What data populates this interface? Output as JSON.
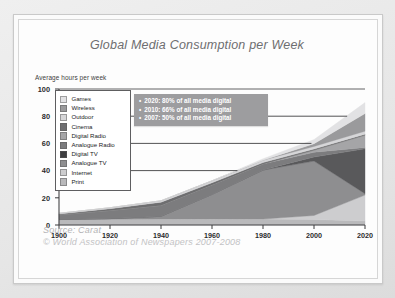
{
  "figure": {
    "title": "Global Media Consumption per Week",
    "source_label": "Source:  Carat",
    "copyright": "© World Association of Newspapers 2007-2008"
  },
  "annotation": {
    "bullet": "•",
    "lines": [
      "2020: 80% of all media digital",
      "2010: 66% of all media digital",
      "2007: 50% of all media digital"
    ],
    "background": "#9d9d9f",
    "text_color": "#ffffff"
  },
  "chart_data": {
    "type": "area",
    "title": "Global Media Consumption per Week",
    "xlabel": "",
    "ylabel": "Average hours per week",
    "xlim": [
      1900,
      2020
    ],
    "ylim": [
      0,
      100
    ],
    "grid": false,
    "stacked": true,
    "legend_position": "inside-top-left",
    "x": [
      1900,
      1920,
      1940,
      1960,
      1980,
      2000,
      2020
    ],
    "xticks": [
      "1900",
      "1920",
      "1940",
      "1960",
      "1980",
      "2000",
      "2020"
    ],
    "yticks": [
      "0",
      "20",
      "40",
      "60",
      "80",
      "100"
    ],
    "series": [
      {
        "name": "Print",
        "color": "#b9b9bb",
        "values": [
          4.0,
          4.2,
          4.4,
          4.5,
          4.4,
          4.0,
          3.0
        ]
      },
      {
        "name": "Internet",
        "color": "#cdcdcf",
        "values": [
          0.0,
          0.0,
          0.0,
          0.0,
          0.0,
          3.0,
          19.0
        ]
      },
      {
        "name": "Analogue TV",
        "color": "#8e8e90",
        "values": [
          0.0,
          0.5,
          2.0,
          18.0,
          36.0,
          40.0,
          1.0
        ]
      },
      {
        "name": "Digital TV",
        "color": "#59595b",
        "values": [
          0.0,
          0.0,
          0.0,
          0.0,
          0.0,
          3.0,
          33.0
        ]
      },
      {
        "name": "Analogue Radio",
        "color": "#7c7c7e",
        "values": [
          3.5,
          6.0,
          8.0,
          7.0,
          4.5,
          3.5,
          1.0
        ]
      },
      {
        "name": "Digital Radio",
        "color": "#a5a5a7",
        "values": [
          0.0,
          0.0,
          0.0,
          0.0,
          0.0,
          1.5,
          9.0
        ]
      },
      {
        "name": "Cinema",
        "color": "#6e6e70",
        "values": [
          0.6,
          1.3,
          2.4,
          1.6,
          1.0,
          0.8,
          0.8
        ]
      },
      {
        "name": "Outdoor",
        "color": "#d6d6d8",
        "values": [
          0.5,
          0.7,
          1.0,
          1.4,
          1.8,
          2.0,
          2.2
        ]
      },
      {
        "name": "Wireless",
        "color": "#9a9a9c",
        "values": [
          0.0,
          0.0,
          0.0,
          0.0,
          0.0,
          2.0,
          13.0
        ]
      },
      {
        "name": "Games",
        "color": "#e2e2e4",
        "values": [
          0.0,
          0.0,
          0.0,
          0.0,
          1.0,
          3.0,
          8.0
        ]
      }
    ],
    "totals": [
      8.6,
      12.7,
      17.8,
      32.5,
      48.7,
      62.8,
      90.0
    ]
  },
  "legend": {
    "items": [
      {
        "label": "Games",
        "color": "#e2e2e4"
      },
      {
        "label": "Wireless",
        "color": "#9a9a9c"
      },
      {
        "label": "Outdoor",
        "color": "#d6d6d8"
      },
      {
        "label": "Cinema",
        "color": "#6e6e70"
      },
      {
        "label": "Digital Radio",
        "color": "#a5a5a7"
      },
      {
        "label": "Analogue Radio",
        "color": "#7c7c7e"
      },
      {
        "label": "Digital TV",
        "color": "#3f3f41"
      },
      {
        "label": "Analogue TV",
        "color": "#8e8e90"
      },
      {
        "label": "Internet",
        "color": "#cdcdcf"
      },
      {
        "label": "Print",
        "color": "#b9b9bb"
      }
    ]
  },
  "leader_lines": [
    {
      "y_value": 80,
      "x_from": 1900,
      "x_to": 2013
    },
    {
      "y_value": 60,
      "x_from": 1900,
      "x_to": 1999
    },
    {
      "y_value": 40,
      "x_from": 1900,
      "x_to": 1970
    }
  ]
}
